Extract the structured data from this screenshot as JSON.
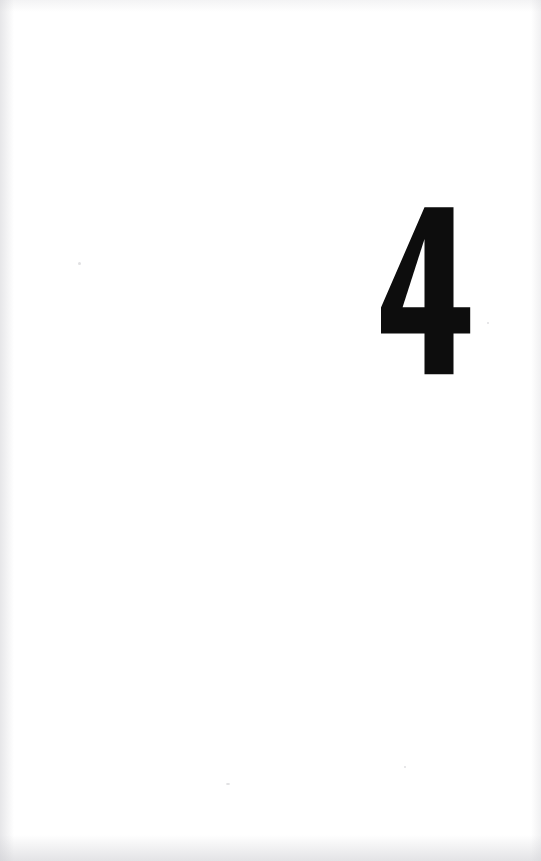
{
  "page": {
    "kind": "chapter-divider",
    "background_color": "#ffffff",
    "width": 541,
    "height": 861
  },
  "chapter": {
    "number": "4",
    "ink_color": "#0d0d0d",
    "position": {
      "left": 374,
      "top": 201,
      "width": 104,
      "height": 182
    }
  },
  "glyph": {
    "name": "numeral-four",
    "view_box": "0 0 104 182",
    "outer_path": "M 50.5 6.2 L 79.5 6.2 L 79.5 106.2 L 96.2 106.2 L 96.2 132.4 L 79.5 132.4 L 79.5 173.2 L 50.5 173.2 L 50.5 132.4 L 7.0 132.4 L 7.0 106.6 Z",
    "counter_path": "M 50.5 38.0 L 50.5 106.2 L 28.6 106.2 Z"
  }
}
